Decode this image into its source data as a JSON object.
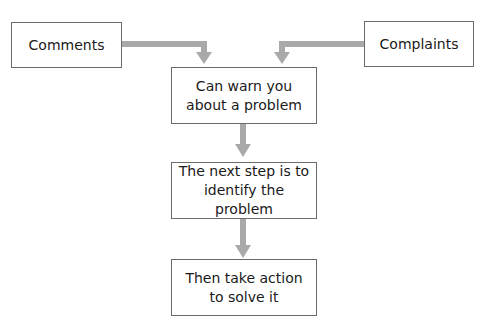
{
  "diagram": {
    "type": "flowchart",
    "colors": {
      "arrow": "#a9a9a9",
      "box_border": "#6a6a6a",
      "text": "#1a1a1a",
      "background": "#ffffff"
    },
    "nodes": [
      {
        "id": "comments",
        "label": "Comments"
      },
      {
        "id": "complaints",
        "label": "Complaints"
      },
      {
        "id": "warn",
        "label": "Can warn you\nabout a problem"
      },
      {
        "id": "identify",
        "label": "The next step is to\nidentify the problem"
      },
      {
        "id": "action",
        "label": "Then take action\nto solve it"
      }
    ],
    "edges": [
      {
        "from": "comments",
        "to": "warn"
      },
      {
        "from": "complaints",
        "to": "warn"
      },
      {
        "from": "warn",
        "to": "identify"
      },
      {
        "from": "identify",
        "to": "action"
      }
    ]
  }
}
